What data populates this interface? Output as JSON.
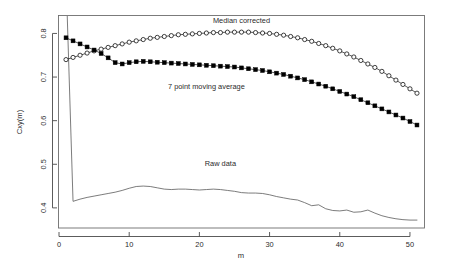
{
  "chart_data": {
    "type": "line",
    "title": "",
    "xlabel": "m",
    "ylabel": "Cxy(m)",
    "xlim": [
      0,
      52
    ],
    "ylim": [
      0.355,
      0.84
    ],
    "grid": false,
    "legend_position": "inline-annotations",
    "x_ticks": [
      0,
      10,
      20,
      30,
      40,
      50
    ],
    "x_tick_labels": [
      "0",
      "10",
      "20",
      "30",
      "40",
      "50"
    ],
    "y_ticks": [
      0.4,
      0.5,
      0.6,
      0.7,
      0.8
    ],
    "y_tick_labels": [
      "0.4",
      "0.5",
      "0.6",
      "0.7",
      "0.8"
    ],
    "annotations": [
      {
        "text": "Median corrected",
        "x": 26,
        "y": 0.825
      },
      {
        "text": "7 point moving average",
        "x": 21,
        "y": 0.672
      },
      {
        "text": "Raw data",
        "x": 23,
        "y": 0.497
      }
    ],
    "series": [
      {
        "name": "Median corrected",
        "marker": "open-circle",
        "color": "#111111",
        "x": [
          1,
          2,
          3,
          4,
          5,
          6,
          7,
          8,
          9,
          10,
          11,
          12,
          13,
          14,
          15,
          16,
          17,
          18,
          19,
          20,
          21,
          22,
          23,
          24,
          25,
          26,
          27,
          28,
          29,
          30,
          31,
          32,
          33,
          34,
          35,
          36,
          37,
          38,
          39,
          40,
          41,
          42,
          43,
          44,
          45,
          46,
          47,
          48,
          49,
          50,
          51
        ],
        "values": [
          0.74,
          0.745,
          0.75,
          0.755,
          0.76,
          0.764,
          0.768,
          0.772,
          0.776,
          0.78,
          0.783,
          0.786,
          0.789,
          0.791,
          0.793,
          0.795,
          0.797,
          0.798,
          0.799,
          0.8,
          0.801,
          0.802,
          0.802,
          0.803,
          0.803,
          0.803,
          0.803,
          0.802,
          0.801,
          0.8,
          0.798,
          0.796,
          0.793,
          0.79,
          0.786,
          0.782,
          0.777,
          0.772,
          0.766,
          0.76,
          0.753,
          0.746,
          0.738,
          0.73,
          0.722,
          0.713,
          0.703,
          0.693,
          0.683,
          0.673,
          0.663
        ]
      },
      {
        "name": "7 point moving average",
        "marker": "filled-square",
        "color": "#000000",
        "x": [
          1,
          2,
          3,
          4,
          5,
          6,
          7,
          8,
          9,
          10,
          11,
          12,
          13,
          14,
          15,
          16,
          17,
          18,
          19,
          20,
          21,
          22,
          23,
          24,
          25,
          26,
          27,
          28,
          29,
          30,
          31,
          32,
          33,
          34,
          35,
          36,
          37,
          38,
          39,
          40,
          41,
          42,
          43,
          44,
          45,
          46,
          47,
          48,
          49,
          50,
          51
        ],
        "values": [
          0.79,
          0.783,
          0.776,
          0.769,
          0.762,
          0.754,
          0.744,
          0.733,
          0.73,
          0.733,
          0.735,
          0.736,
          0.735,
          0.734,
          0.733,
          0.732,
          0.731,
          0.73,
          0.729,
          0.728,
          0.727,
          0.726,
          0.725,
          0.724,
          0.723,
          0.721,
          0.719,
          0.717,
          0.715,
          0.712,
          0.709,
          0.706,
          0.702,
          0.698,
          0.694,
          0.689,
          0.684,
          0.679,
          0.673,
          0.667,
          0.661,
          0.655,
          0.648,
          0.641,
          0.634,
          0.627,
          0.62,
          0.613,
          0.606,
          0.598,
          0.59
        ]
      },
      {
        "name": "Raw data",
        "marker": "none",
        "color": "#5a5a5a",
        "x": [
          1,
          2,
          3,
          4,
          5,
          6,
          7,
          8,
          9,
          10,
          11,
          12,
          13,
          14,
          15,
          16,
          17,
          18,
          19,
          20,
          21,
          22,
          23,
          24,
          25,
          26,
          27,
          28,
          29,
          30,
          31,
          32,
          33,
          34,
          35,
          36,
          37,
          38,
          39,
          40,
          41,
          42,
          43,
          44,
          45,
          46,
          47,
          48,
          49,
          50,
          51
        ],
        "values": [
          0.93,
          0.415,
          0.42,
          0.424,
          0.427,
          0.43,
          0.433,
          0.436,
          0.44,
          0.445,
          0.449,
          0.45,
          0.449,
          0.446,
          0.443,
          0.442,
          0.443,
          0.443,
          0.442,
          0.441,
          0.442,
          0.443,
          0.442,
          0.44,
          0.438,
          0.435,
          0.434,
          0.434,
          0.433,
          0.43,
          0.426,
          0.423,
          0.42,
          0.418,
          0.412,
          0.405,
          0.407,
          0.398,
          0.394,
          0.393,
          0.395,
          0.39,
          0.391,
          0.395,
          0.388,
          0.382,
          0.378,
          0.375,
          0.373,
          0.372,
          0.372
        ]
      }
    ]
  }
}
